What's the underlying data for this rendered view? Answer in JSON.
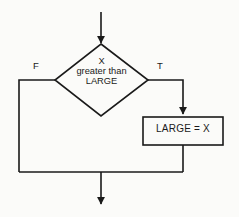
{
  "diagram": {
    "type": "flowchart",
    "title": "",
    "background_color": "#fbfbf9",
    "line_color": "#1a1a1a",
    "text_color": "#1a1a1a",
    "nodes": [
      {
        "id": "decision",
        "shape": "diamond",
        "text_lines": [
          "X",
          "greater than",
          "LARGE"
        ]
      },
      {
        "id": "process",
        "shape": "rectangle",
        "text": "LARGE  =  X"
      }
    ],
    "edges": [
      {
        "id": "entry",
        "from": "",
        "to": "decision",
        "label": ""
      },
      {
        "id": "true-branch",
        "from": "decision",
        "to": "process",
        "label": "T"
      },
      {
        "id": "false-branch",
        "from": "decision",
        "to": "merge",
        "label": "F"
      },
      {
        "id": "process-to-merge",
        "from": "process",
        "to": "merge",
        "label": ""
      },
      {
        "id": "exit",
        "from": "merge",
        "to": "",
        "label": ""
      }
    ]
  }
}
